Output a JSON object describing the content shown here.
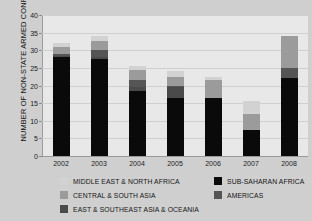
{
  "chart_data": {
    "type": "bar",
    "subtype": "stacked-bar",
    "title": "",
    "xlabel": "",
    "ylabel": "NUMBER OF NON-STATE ARMED CONFLICTS",
    "categories": [
      "2002",
      "2003",
      "2004",
      "2005",
      "2006",
      "2007",
      "2008"
    ],
    "ylim": [
      0,
      40
    ],
    "yticks": [
      0,
      5,
      10,
      15,
      20,
      25,
      30,
      35,
      40
    ],
    "grid": true,
    "legend_position": "bottom",
    "series": [
      {
        "name": "SUB-SAHARAN AFRICA",
        "color": "#0a0a0a",
        "values": [
          28,
          27.5,
          18.5,
          16.5,
          16.5,
          7.5,
          22
        ]
      },
      {
        "name": "EAST & SOUTHEAST ASIA & OCEANIA",
        "color": "#4a4a4a",
        "values": [
          0.5,
          0.5,
          1,
          3,
          0,
          0,
          0
        ]
      },
      {
        "name": "AMERICAS",
        "color": "#555555",
        "values": [
          0.5,
          2,
          2,
          0.5,
          0,
          0,
          3
        ]
      },
      {
        "name": "CENTRAL & SOUTH ASIA",
        "color": "#9b9b9b",
        "values": [
          2,
          2.5,
          3,
          2.5,
          5,
          4.5,
          9
        ]
      },
      {
        "name": "MIDDLE EAST & NORTH AFRICA",
        "color": "#d2d2d2",
        "values": [
          1,
          1.5,
          1,
          1.5,
          1,
          3.5,
          0
        ]
      }
    ],
    "totals": [
      32,
      34,
      25.5,
      24,
      22.5,
      15.5,
      34
    ]
  },
  "legend": {
    "items": [
      {
        "label": "MIDDLE EAST & NORTH AFRICA",
        "color": "#d2d2d2"
      },
      {
        "label": "CENTRAL & SOUTH ASIA",
        "color": "#9b9b9b"
      },
      {
        "label": "EAST & SOUTHEAST ASIA & OCEANIA",
        "color": "#4a4a4a"
      },
      {
        "label": "SUB-SAHARAN AFRICA",
        "color": "#0a0a0a"
      },
      {
        "label": "AMERICAS",
        "color": "#555555"
      }
    ]
  },
  "colors": {
    "background": "#cfcfcf",
    "plot_background": "#e8e8e8",
    "grid": "#d0d0d0",
    "axis": "#9a9a9a",
    "text": "#141414"
  }
}
